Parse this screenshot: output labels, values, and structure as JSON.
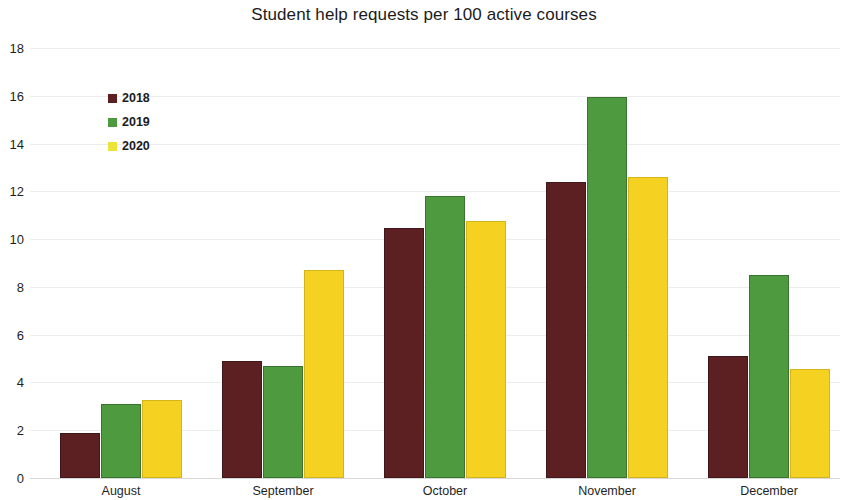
{
  "chart_data": {
    "type": "bar",
    "title": "Student help requests per 100 active courses",
    "xlabel": "",
    "ylabel": "",
    "categories": [
      "August",
      "September",
      "October",
      "November",
      "December"
    ],
    "series": [
      {
        "name": "2018",
        "color": "#5C2023",
        "values": [
          1.9,
          4.9,
          10.45,
          12.4,
          5.1
        ]
      },
      {
        "name": "2019",
        "color": "#4E9A3E",
        "values": [
          3.1,
          4.7,
          11.8,
          15.95,
          8.5
        ]
      },
      {
        "name": "2020",
        "color": "#F5D221",
        "values": [
          3.25,
          8.7,
          10.75,
          12.6,
          4.55
        ]
      }
    ],
    "ylim": [
      0,
      18
    ],
    "ytick_step": 2,
    "ytick_labels": [
      "0",
      "2",
      "4",
      "6",
      "8",
      "10",
      "12",
      "14",
      "16",
      "18"
    ],
    "grid": true,
    "legend_position": "upper-left-inside",
    "background": "#FFFFFF",
    "gridline_color": "#EDEDED",
    "axis_color": "#C9C9C9"
  }
}
